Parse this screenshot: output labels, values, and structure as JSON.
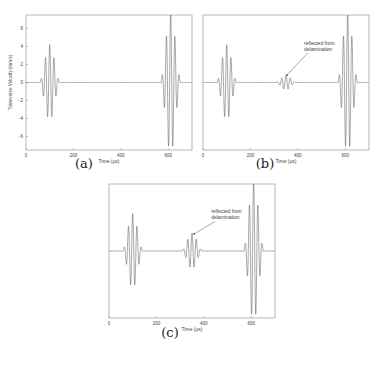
{
  "chart_data": [
    {
      "id": "a",
      "type": "line",
      "caption": "(a)",
      "title": "",
      "xlabel": "Time (μs)",
      "ylabel": "Transverse Velocity (mm/s)",
      "xticks": [
        0,
        200,
        400,
        600
      ],
      "yticks": [
        6,
        4,
        2,
        0,
        -2,
        -4,
        -6
      ],
      "xlim": [
        0,
        700
      ],
      "ylim": [
        -7.5,
        7.5
      ],
      "grid": false,
      "packets": [
        {
          "center": 100,
          "amplitude": 4.2,
          "label": "incident"
        },
        {
          "center": 610,
          "amplitude": 7.8,
          "label": "reflected from end"
        }
      ],
      "annotation": null
    },
    {
      "id": "b",
      "type": "line",
      "caption": "(b)",
      "title": "",
      "xlabel": "Time (μs)",
      "ylabel": "",
      "xticks": [
        0,
        200,
        400,
        600
      ],
      "yticks": [],
      "xlim": [
        0,
        700
      ],
      "ylim": [
        -7.5,
        7.5
      ],
      "grid": false,
      "packets": [
        {
          "center": 100,
          "amplitude": 4.2,
          "label": "incident"
        },
        {
          "center": 350,
          "amplitude": 0.8,
          "label": "reflected from delamination"
        },
        {
          "center": 610,
          "amplitude": 7.8,
          "label": "reflected from end"
        }
      ],
      "annotation": {
        "text_lines": [
          "reflected from",
          "delamination"
        ],
        "target_time": 350
      }
    },
    {
      "id": "c",
      "type": "line",
      "caption": "(c)",
      "title": "",
      "xlabel": "Time (μs)",
      "ylabel": "",
      "xticks": [
        0,
        200,
        400,
        600
      ],
      "yticks": [],
      "xlim": [
        0,
        700
      ],
      "ylim": [
        -7.5,
        7.5
      ],
      "grid": false,
      "packets": [
        {
          "center": 100,
          "amplitude": 4.2,
          "label": "incident"
        },
        {
          "center": 350,
          "amplitude": 2.0,
          "label": "reflected from delamination"
        },
        {
          "center": 610,
          "amplitude": 7.8,
          "label": "reflected from end"
        }
      ],
      "annotation": {
        "text_lines": [
          "reflected from",
          "delamination"
        ],
        "target_time": 355
      }
    }
  ],
  "layout": [
    {
      "x": 26,
      "y": 15,
      "w": 166,
      "h": 135,
      "capX": 84,
      "capY": 164
    },
    {
      "x": 203,
      "y": 15,
      "w": 166,
      "h": 135,
      "capX": 265,
      "capY": 164
    },
    {
      "x": 109,
      "y": 184,
      "w": 166,
      "h": 134,
      "capX": 170,
      "capY": 333
    }
  ],
  "colors": {
    "line": "#555555",
    "axis": "#888888",
    "text": "#444444"
  }
}
